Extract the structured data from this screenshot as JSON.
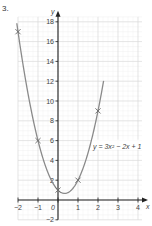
{
  "question_number": "3.",
  "chart_data": {
    "type": "line",
    "title": "",
    "xlabel": "x",
    "ylabel": "y",
    "equation_label": "y = 3x² − 2x + 1",
    "xlim": [
      -2,
      4.2
    ],
    "ylim": [
      -2,
      18.5
    ],
    "x_ticks": [
      -2,
      -1,
      0,
      1,
      2,
      3,
      4
    ],
    "y_ticks": [
      -2,
      2,
      4,
      6,
      8,
      10,
      12,
      14,
      16,
      18
    ],
    "grid": true,
    "series": [
      {
        "name": "y = 3x² − 2x + 1",
        "function": "3x^2 - 2x + 1",
        "marked_points": [
          {
            "x": -2,
            "y": 17
          },
          {
            "x": -1,
            "y": 6
          },
          {
            "x": 0,
            "y": 1
          },
          {
            "x": 1,
            "y": 2
          },
          {
            "x": 2,
            "y": 9
          }
        ]
      }
    ],
    "colors": {
      "curve": "#8a8a8a",
      "axis": "#222222",
      "grid_major": "#d8d8d8",
      "grid_minor": "#eeeeee"
    }
  }
}
